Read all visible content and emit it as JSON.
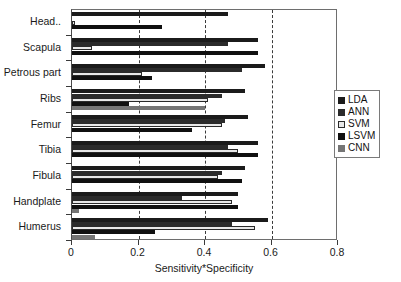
{
  "chart_data": {
    "type": "bar",
    "orientation": "horizontal",
    "title": "",
    "xlabel": "Sensitivity*Specificity",
    "ylabel": "",
    "xlim": [
      0,
      0.8
    ],
    "xticks": [
      "0",
      "0.2",
      "0.4",
      "0.6",
      "0.8"
    ],
    "xtick_values": [
      0,
      0.2,
      0.4,
      0.6,
      0.8
    ],
    "grid": "vertical-dashed",
    "legend_position": "right",
    "categories": [
      "Head..",
      "Scapula",
      "Petrous part",
      "Ribs",
      "Femur",
      "Tibia",
      "Fibula",
      "Handplate",
      "Humerus"
    ],
    "series": [
      {
        "name": "LDA",
        "color": "#1b1b1b",
        "values": [
          0.47,
          0.56,
          0.58,
          0.52,
          0.53,
          0.56,
          0.52,
          0.5,
          0.59
        ]
      },
      {
        "name": "ANN",
        "color": "#2b2b2b",
        "values": [
          0.0,
          0.47,
          0.51,
          0.45,
          0.46,
          0.47,
          0.45,
          0.33,
          0.48
        ]
      },
      {
        "name": "SVM",
        "color": "#e8e8e8",
        "values": [
          0.01,
          0.06,
          0.21,
          0.41,
          0.45,
          0.5,
          0.44,
          0.48,
          0.55
        ]
      },
      {
        "name": "LSVM",
        "color": "#101010",
        "values": [
          0.27,
          0.56,
          0.24,
          0.17,
          0.36,
          0.56,
          0.51,
          0.5,
          0.25
        ]
      },
      {
        "name": "CNN",
        "color": "#757575",
        "values": [
          0.0,
          0.0,
          0.0,
          0.4,
          0.0,
          0.0,
          0.0,
          0.02,
          0.07
        ]
      }
    ]
  },
  "legend": {
    "items": [
      {
        "label": "LDA",
        "swatch": "lda"
      },
      {
        "label": "ANN",
        "swatch": "ann"
      },
      {
        "label": "SVM",
        "swatch": "svm"
      },
      {
        "label": "LSVM",
        "swatch": "lsvm"
      },
      {
        "label": "CNN",
        "swatch": "cnn"
      }
    ]
  }
}
